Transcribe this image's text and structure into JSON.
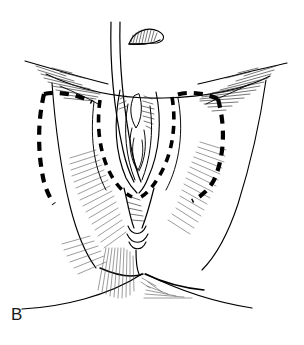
{
  "figure": {
    "panel_label": "B",
    "style": "black ink line drawing with hatch shading on white background",
    "width": 304,
    "height": 345,
    "colors": {
      "background": "#ffffff",
      "ink": "#000000",
      "hatch": "#2b2b2b",
      "hatch_light": "#4a4a4a",
      "label": "#1a1a1a"
    }
  },
  "elements": {
    "panel_label": "B",
    "detached_fragment_label": "excised tissue fragment",
    "catheter_label": "catheter",
    "incision_label": "dashed incision marking",
    "outer_contour_label": "thigh and perineal contour",
    "center_structure_label": "introitus and labial folds",
    "perineal_body_label": "perineal body",
    "anal_region_label": "anal region"
  },
  "geometry": {
    "outer": {
      "left_upper_curve": "M 26 62 C 58 70 86 78 112 83",
      "right_upper_curve": "M 196 83 C 226 78 258 70 286 64",
      "mid_arc": "M 48 76 C 96 96 200 96 268 77",
      "left_lower_curve": "M 24 309 C 62 306 106 296 140 276",
      "right_lower_curve": "M 160 276 C 194 292 226 302 254 307",
      "left_flank": "M 52 84 C 56 140 62 196 72 236",
      "right_flank": "M 262 82 C 252 140 238 198 226 238"
    },
    "incisions": {
      "left_outer": "M 44 93 C 38 132 40 170 48 205",
      "left_outer_top": "M 44 93 C 58 92 76 95 90 101",
      "left_inner": "M 104 99 C 100 130 104 162 120 186",
      "right_outer_top": "M 220 99 C 206 94 190 92 178 95",
      "right_outer": "M 222 99 C 228 134 220 170 196 196",
      "right_inner": "M 172 97 C 174 130 166 162 146 187"
    },
    "catheter": {
      "line_a": "M 110 22 C 110 60 114 110 126 160",
      "line_b": "M 120 22 C 120 62 124 112 134 162"
    },
    "fragment": {
      "outline": "M 130 40 C 136 30 150 27 160 33 C 166 37 164 42 156 43 L 132 43 Z",
      "baseline": "M 130 43 L 160 41"
    },
    "center": {
      "left_fold": "M 122 88 C 116 120 118 152 132 180",
      "right_fold": "M 152 88 C 158 118 154 150 142 180",
      "inner_left": "M 128 100 C 124 128 128 156 136 178",
      "inner_right": "M 146 100 C 150 126 146 154 140 178",
      "clitoral": "M 134 92 C 130 104 132 116 138 124 C 142 116 142 102 138 92 Z"
    },
    "perineum": {
      "body": "M 126 186 C 130 200 132 214 136 224 C 142 216 146 202 150 188",
      "anal_center": "M 138 226 C 137 244 138 262 140 276",
      "anal_fold_a": "M 130 232 C 134 242 142 242 146 232",
      "anal_fold_b": "M 129 240 C 134 250 143 250 148 240"
    }
  }
}
